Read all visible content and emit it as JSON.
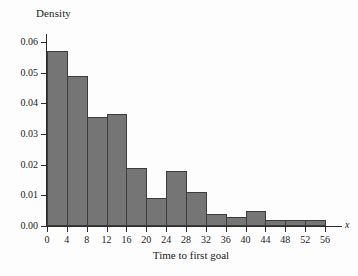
{
  "chart_data": {
    "type": "bar",
    "title": "",
    "subtitle": "",
    "xlabel": "Time to first goal",
    "ylabel": "Density",
    "x_variable_symbol": "x",
    "grid": false,
    "legend": null,
    "legend_position": "none",
    "xlim": [
      0,
      58
    ],
    "ylim": [
      0.0,
      0.06
    ],
    "bin_width": 4,
    "x_ticks": [
      0,
      4,
      8,
      12,
      16,
      20,
      24,
      28,
      32,
      36,
      40,
      44,
      48,
      52,
      56
    ],
    "x_tick_labels": [
      "0",
      "4",
      "8",
      "12",
      "16",
      "20",
      "24",
      "28",
      "32",
      "36",
      "40",
      "44",
      "48",
      "52",
      "56"
    ],
    "y_ticks": [
      0.0,
      0.01,
      0.02,
      0.03,
      0.04,
      0.05,
      0.06
    ],
    "y_tick_labels": [
      "0.00",
      "0.01",
      "0.02",
      "0.03",
      "0.04",
      "0.05",
      "0.06"
    ],
    "bin_edges": [
      0,
      4,
      8,
      12,
      16,
      20,
      24,
      28,
      32,
      36,
      40,
      44,
      48,
      52,
      56
    ],
    "categories": [
      "0-4",
      "4-8",
      "8-12",
      "12-16",
      "16-20",
      "20-24",
      "24-28",
      "28-32",
      "32-36",
      "36-40",
      "40-44",
      "44-48",
      "48-52",
      "52-56"
    ],
    "values": [
      0.057,
      0.049,
      0.0355,
      0.0365,
      0.019,
      0.009,
      0.018,
      0.011,
      0.004,
      0.0028,
      0.005,
      0.002,
      0.002,
      0.002
    ],
    "bar_fill_color": "#757575",
    "bar_edge_color": "#3c3c3c",
    "axis_color": "#2a2a2a",
    "background_color": "#fdfdfd"
  }
}
